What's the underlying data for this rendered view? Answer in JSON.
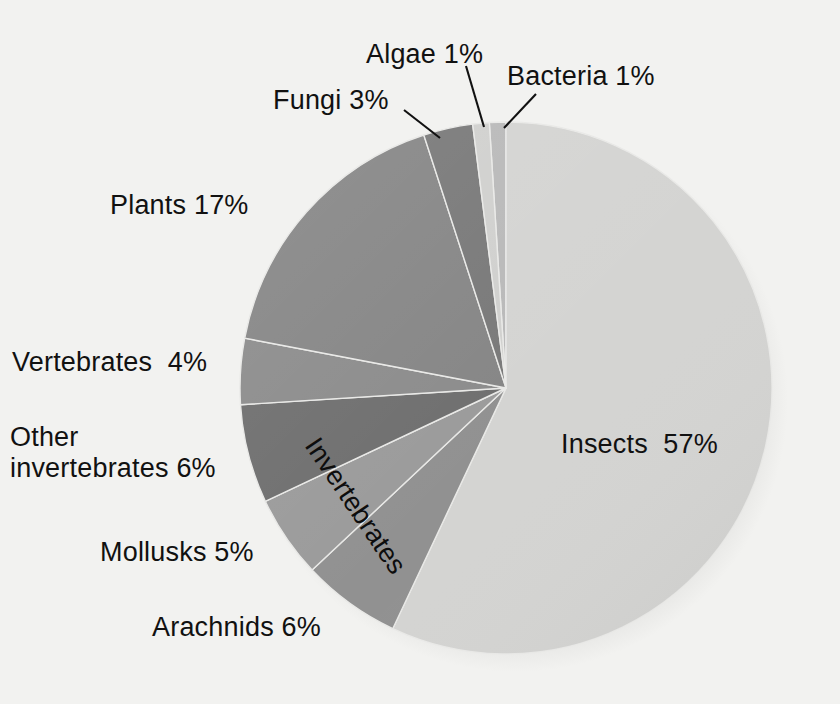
{
  "chart_data": {
    "type": "pie",
    "title": "",
    "subtitle": "",
    "xlabel": "",
    "ylabel": "",
    "legend_position": "none",
    "grid": false,
    "units": "percent",
    "total": 100,
    "categories": [
      "Bacteria",
      "Insects",
      "Arachnids",
      "Mollusks",
      "Other invertebrates",
      "Vertebrates",
      "Plants",
      "Fungi",
      "Algae"
    ],
    "values": [
      1,
      57,
      6,
      5,
      6,
      4,
      17,
      3,
      1
    ],
    "slices": [
      {
        "id": "bacteria",
        "label": "Bacteria 1%",
        "name": "Bacteria",
        "value": 1,
        "color": "#b9b9b9"
      },
      {
        "id": "insects",
        "label": "Insects  57%",
        "name": "Insects",
        "value": 57,
        "color": "#d4d4d2"
      },
      {
        "id": "arachnids",
        "label": "Arachnids 6%",
        "name": "Arachnids",
        "value": 6,
        "color": "#919191"
      },
      {
        "id": "mollusks",
        "label": "Mollusks 5%",
        "name": "Mollusks",
        "value": 5,
        "color": "#9b9b9b"
      },
      {
        "id": "other-inverts",
        "label": "Other\ninvertebrates 6%",
        "name": "Other invertebrates",
        "value": 6,
        "color": "#6f6f6f"
      },
      {
        "id": "vertebrates",
        "label": "Vertebrates  4%",
        "name": "Vertebrates",
        "value": 4,
        "color": "#8c8c8c"
      },
      {
        "id": "plants",
        "label": "Plants 17%",
        "name": "Plants",
        "value": 17,
        "color": "#868686"
      },
      {
        "id": "fungi",
        "label": "Fungi 3%",
        "name": "Fungi",
        "value": 3,
        "color": "#797979"
      },
      {
        "id": "algae",
        "label": "Algae 1%",
        "name": "Algae",
        "value": 1,
        "color": "#d0d0ce"
      }
    ],
    "annotations": [
      {
        "id": "invertebrates-group",
        "text": "Invertebrates",
        "rotation_deg": 56
      }
    ],
    "background_color": "#f2f2f0",
    "text_color": "#111111"
  },
  "labels": {
    "algae": "Algae 1%",
    "bacteria": "Bacteria 1%",
    "fungi": "Fungi 3%",
    "plants": "Plants 17%",
    "vertebrates": "Vertebrates  4%",
    "other_invertebrates_line1": "Other",
    "other_invertebrates_line2": "invertebrates 6%",
    "mollusks": "Mollusks 5%",
    "arachnids": "Arachnids 6%",
    "insects": "Insects  57%",
    "invertebrates_group": "Invertebrates"
  }
}
